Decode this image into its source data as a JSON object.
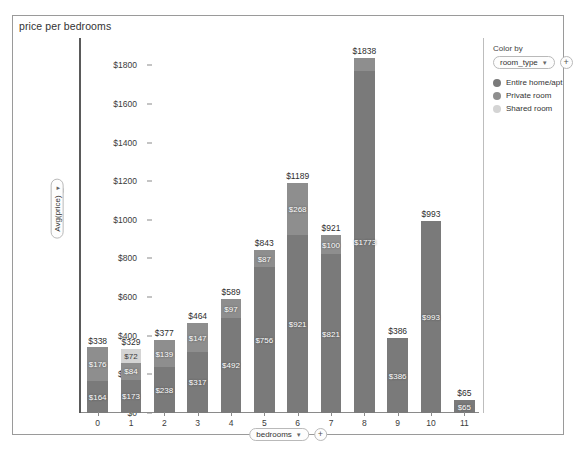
{
  "viz": {
    "title": "price per bedrooms"
  },
  "y_encoding": {
    "field_label": "Avg(price)",
    "caret": "▼",
    "add_label": "+"
  },
  "x_encoding": {
    "field_label": "bedrooms",
    "caret": "▼",
    "add_label": "+"
  },
  "legend": {
    "title": "Color by",
    "field_label": "room_type",
    "caret": "▼",
    "add_label": "+",
    "items": [
      {
        "label": "Entire home/apt",
        "color": "#7a7a7a"
      },
      {
        "label": "Private room",
        "color": "#8e8e8e"
      },
      {
        "label": "Shared room",
        "color": "#d4d4d4"
      }
    ]
  },
  "chart_data": {
    "type": "bar",
    "subtype": "stacked-bar",
    "title": "price per bedrooms",
    "xlabel": "bedrooms",
    "ylabel": "Avg(price)",
    "ylim": [
      0,
      1900
    ],
    "grid": false,
    "legend_position": "right",
    "categories": [
      "0",
      "1",
      "2",
      "3",
      "4",
      "5",
      "6",
      "7",
      "8",
      "9",
      "10",
      "11"
    ],
    "ytick_labels": [
      "$0",
      "$200",
      "$400",
      "$600",
      "$800",
      "$1000",
      "$1200",
      "$1400",
      "$1600",
      "$1800"
    ],
    "ytick_values": [
      0,
      200,
      400,
      600,
      800,
      1000,
      1200,
      1400,
      1600,
      1800
    ],
    "totals": [
      338,
      329,
      377,
      464,
      589,
      843,
      1189,
      921,
      1838,
      386,
      993,
      65
    ],
    "total_labels": [
      "$338",
      "$329",
      "$377",
      "$464",
      "$589",
      "$843",
      "$1189",
      "$921",
      "$1838",
      "$386",
      "$993",
      "$65"
    ],
    "series": [
      {
        "name": "Entire home/apt",
        "color": "#7a7a7a",
        "values": [
          164,
          173,
          238,
          317,
          492,
          756,
          921,
          821,
          1773,
          386,
          993,
          65
        ],
        "labels": [
          "$164",
          "$173",
          "$238",
          "$317",
          "$492",
          "$756",
          "$921",
          "$821",
          "$1773",
          "$386",
          "$993",
          "$65"
        ]
      },
      {
        "name": "Private room",
        "color": "#8e8e8e",
        "values": [
          176,
          84,
          139,
          147,
          97,
          87,
          268,
          100,
          65,
          0,
          0,
          0
        ],
        "labels": [
          "$176",
          "$84",
          "$139",
          "$147",
          "$97",
          "$87",
          "$268",
          "$100",
          "",
          "",
          "",
          ""
        ]
      },
      {
        "name": "Shared room",
        "color": "#d4d4d4",
        "values": [
          0,
          72,
          0,
          0,
          0,
          0,
          0,
          0,
          0,
          0,
          0,
          0
        ],
        "labels": [
          "",
          "$72",
          "",
          "",
          "",
          "",
          "",
          "",
          "",
          "",
          "",
          ""
        ]
      }
    ]
  }
}
